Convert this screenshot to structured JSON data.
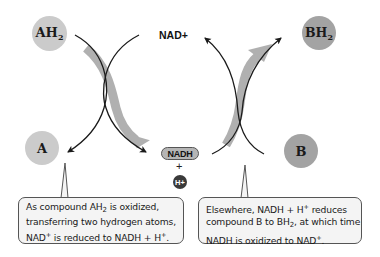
{
  "diagram": {
    "nodes": {
      "ah2": {
        "label": "AH",
        "sub": "2",
        "color": "#cbcbcb"
      },
      "a": {
        "label": "A",
        "color": "#cbcbcb"
      },
      "bh2": {
        "label": "BH",
        "sub": "2",
        "color": "#a3a3a3"
      },
      "b": {
        "label": "B",
        "color": "#a3a3a3"
      },
      "nad_plus": {
        "label": "NAD+"
      },
      "nadh": {
        "label": "NADH",
        "color": "#b5b5b5"
      },
      "plus": {
        "label": "+"
      },
      "h_plus": {
        "label": "H+",
        "color": "#3a3a3a"
      }
    },
    "colors": {
      "line": "#1a1a1a",
      "flow_arrow": "#b0b0b0",
      "callout_bg": "#f4f4f4",
      "callout_border": "#555555"
    },
    "callouts": [
      {
        "lines": [
          {
            "parts": [
              "As compound AH",
              "2",
              " is oxidized,"
            ]
          },
          {
            "parts": [
              "transferring two hydrogen atoms,"
            ]
          },
          {
            "parts": [
              "NAD",
              "+",
              " is reduced to NADH + H",
              "+",
              "."
            ]
          }
        ]
      },
      {
        "lines": [
          {
            "parts": [
              "Elsewhere, NADH + H",
              "+",
              " reduces"
            ]
          },
          {
            "parts": [
              "compound B to BH",
              "2",
              ", at which time"
            ]
          },
          {
            "parts": [
              "NADH is oxidized to NAD",
              "+",
              "."
            ]
          }
        ]
      }
    ]
  }
}
